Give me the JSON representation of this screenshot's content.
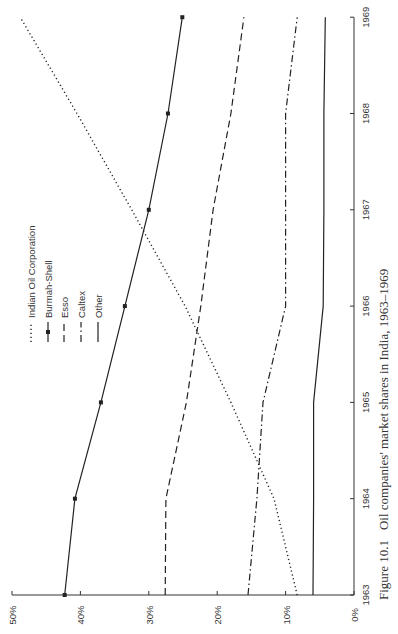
{
  "caption": {
    "number": "Figure 10.1",
    "text": "Oil companies' market shares in India, 1963–1969"
  },
  "chart_data": {
    "type": "line",
    "title": "Oil companies' market shares in India, 1963–1969",
    "xlabel": "",
    "ylabel": "",
    "x": [
      1963,
      1964,
      1965,
      1966,
      1967,
      1968,
      1969
    ],
    "x_tick_labels": [
      "1963",
      "1964",
      "1965",
      "1966",
      "1967",
      "1968",
      "1969"
    ],
    "y_tick_labels": [
      "0%",
      "10%",
      "20%",
      "30%",
      "40%",
      "50%"
    ],
    "ylim": [
      0,
      50
    ],
    "grid": false,
    "legend_position": "upper-left (rotated)",
    "orientation": "rotated 90° counter-clockwise",
    "series": [
      {
        "name": "Indian Oil Corporation",
        "style": "dotted",
        "values": [
          8.3,
          11.7,
          18.0,
          24.7,
          32.5,
          40.5,
          48.8
        ]
      },
      {
        "name": "Burmah-Shell",
        "style": "solid-square-markers",
        "values": [
          42.3,
          40.8,
          37.0,
          33.5,
          30.0,
          27.2,
          25.1
        ]
      },
      {
        "name": "Esso",
        "style": "dashed",
        "values": [
          27.6,
          27.5,
          24.5,
          22.4,
          20.6,
          18.0,
          16.1
        ]
      },
      {
        "name": "Caltex",
        "style": "dash-dot",
        "values": [
          15.5,
          14.2,
          13.3,
          10.0,
          10.0,
          10.0,
          8.3
        ]
      },
      {
        "name": "Other",
        "style": "solid",
        "values": [
          6.0,
          5.9,
          5.9,
          4.5,
          4.4,
          4.4,
          4.2
        ]
      }
    ]
  }
}
